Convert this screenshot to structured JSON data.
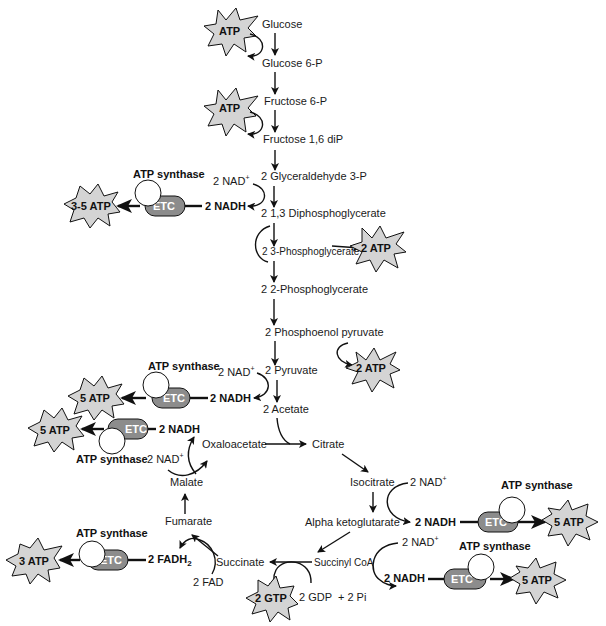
{
  "diagram": {
    "colors": {
      "star_fill": "#d4d4d4",
      "etc_fill": "#8c8c8c",
      "synthase_fill": "#ffffff",
      "stroke": "#111111"
    },
    "glycolysis": [
      "Glucose",
      "Glucose 6-P",
      "Fructose 6-P",
      "Fructose 1,6 diP",
      "2 Glyceraldehyde 3-P",
      "2 1,3 Diphosphoglycerate",
      "2 3-Phosphoglycerate",
      "2 2-Phosphoglycerate",
      "2 Phosphoenol pyruvate",
      "2 Pyruvate",
      "2 Acetate"
    ],
    "krebs": {
      "citrate": "Citrate",
      "isocitrate": "Isocitrate",
      "alpha_kg": "Alpha ketoglutarate",
      "succinyl_coa": "Succinyl CoA",
      "succinate": "Succinate",
      "fumarate": "Fumarate",
      "malate": "Malate",
      "oxaloacetate": "Oxaloacetate"
    },
    "cofactors": {
      "nad_plus": "2 NAD",
      "nad_plus_sup": "+",
      "nadh": "2 NADH",
      "fad": "2 FAD",
      "fadh2": "2 FADH",
      "fadh2_sub": "2",
      "gdp": "2 GDP  + 2 Pi"
    },
    "stars": {
      "atp": "ATP",
      "two_atp": "2 ATP",
      "three_five_atp": "3-5 ATP",
      "five_atp": "5 ATP",
      "three_atp": "3 ATP",
      "two_gtp": "2 GTP"
    },
    "etc_label": "ETC",
    "synthase_label": "ATP synthase"
  }
}
